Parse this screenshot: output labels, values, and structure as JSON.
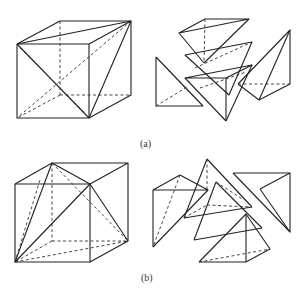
{
  "figure": {
    "panels": [
      {
        "id": "a",
        "caption": "(a)",
        "description": "Cube dissected into tetrahedra along a space diagonal, with exploded view of pieces"
      },
      {
        "id": "b",
        "caption": "(b)",
        "description": "Cube dissected into pyramids/tetrahedra from one vertex, with exploded view of pieces"
      }
    ],
    "colors": {
      "line": "#222222",
      "background": "#ffffff"
    }
  }
}
